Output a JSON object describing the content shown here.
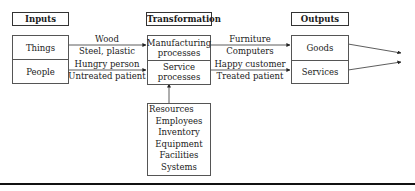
{
  "headers": {
    "inputs": "Inputs",
    "transformation": "Transformation",
    "outputs": "Outputs"
  },
  "inputs": {
    "cells": [
      "Things",
      "People"
    ]
  },
  "transformation": {
    "cells": [
      "Manufacturing processes",
      "Service processes"
    ],
    "cell_lines": [
      [
        "Manufacturing",
        "processes"
      ],
      [
        "Service",
        "processes"
      ]
    ]
  },
  "outputs": {
    "cells": [
      "Goods",
      "Services"
    ]
  },
  "input_flows": [
    {
      "above": "Wood",
      "below": "Steel, plastic"
    },
    {
      "above": "Hungry person",
      "below": "Untreated patient"
    }
  ],
  "output_flows": [
    {
      "above": "Furniture",
      "below": "Computers"
    },
    {
      "above": "Happy customer",
      "below": "Treated patient"
    }
  ],
  "resources": {
    "title": "Resources",
    "items": [
      "Employees",
      "Inventory",
      "Equipment",
      "Facilities",
      "Systems"
    ]
  },
  "colors": {
    "line": "#333333",
    "box_border": "#555555",
    "text": "#1a1a1a",
    "background": "#ffffff"
  }
}
